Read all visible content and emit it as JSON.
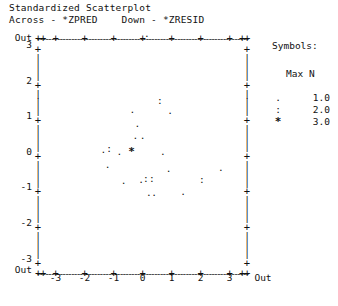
{
  "header": {
    "title": "Standardized Scatterplot",
    "axes_description": "Across - *ZPRED    Down - *ZRESID",
    "across_var": "*ZPRED",
    "down_var": "*ZRESID"
  },
  "legend": {
    "heading": "Symbols:",
    "column_header": "Max N",
    "entries": [
      {
        "symbol": ".",
        "value": "1.0"
      },
      {
        "symbol": ":",
        "value": "2.0"
      },
      {
        "symbol": "*",
        "value": "3.0"
      }
    ]
  },
  "axis": {
    "y_labels": [
      "Out",
      "3",
      "2",
      "1",
      "0",
      "-1",
      "-2",
      "-3",
      "Out"
    ],
    "x_labels": [
      "-3",
      "-2",
      "-1",
      "0",
      "1",
      "2",
      "3",
      "Out"
    ],
    "out_label": "Out",
    "tick_glyph": "+",
    "dash_glyph": "-",
    "bar_glyph": "|"
  },
  "chart_data": {
    "type": "scatter",
    "title": "Standardized Scatterplot",
    "xlabel": "*ZPRED",
    "ylabel": "*ZRESID",
    "xlim": [
      -3.5,
      3.5
    ],
    "ylim": [
      -3.5,
      3.5
    ],
    "grid": false,
    "legend_position": "right",
    "symbol_scale": [
      {
        "symbol": ".",
        "max_n": 1.0
      },
      {
        "symbol": ":",
        "max_n": 2.0
      },
      {
        "symbol": "*",
        "max_n": 3.0
      }
    ],
    "points": [
      {
        "x": 0.15,
        "y": 3.45,
        "symbol": "."
      },
      {
        "x": 0.6,
        "y": 1.55,
        "symbol": ":"
      },
      {
        "x": -0.35,
        "y": 1.3,
        "symbol": "."
      },
      {
        "x": 0.95,
        "y": 1.25,
        "symbol": "."
      },
      {
        "x": -0.18,
        "y": 0.9,
        "symbol": "."
      },
      {
        "x": -0.25,
        "y": 0.55,
        "symbol": "."
      },
      {
        "x": 0.0,
        "y": 0.55,
        "symbol": "."
      },
      {
        "x": -1.35,
        "y": 0.15,
        "symbol": "."
      },
      {
        "x": -1.15,
        "y": 0.18,
        "symbol": ":"
      },
      {
        "x": -0.8,
        "y": 0.12,
        "symbol": "."
      },
      {
        "x": -0.38,
        "y": 0.12,
        "symbol": "*"
      },
      {
        "x": 0.7,
        "y": 0.1,
        "symbol": "."
      },
      {
        "x": -1.2,
        "y": -0.25,
        "symbol": "."
      },
      {
        "x": 0.9,
        "y": -0.38,
        "symbol": "."
      },
      {
        "x": 2.7,
        "y": -0.35,
        "symbol": "."
      },
      {
        "x": -0.65,
        "y": -0.7,
        "symbol": "."
      },
      {
        "x": -0.05,
        "y": -0.68,
        "symbol": "."
      },
      {
        "x": 0.12,
        "y": -0.65,
        "symbol": ":"
      },
      {
        "x": 0.32,
        "y": -0.65,
        "symbol": ":"
      },
      {
        "x": 2.05,
        "y": -0.68,
        "symbol": ":"
      },
      {
        "x": 0.22,
        "y": -1.05,
        "symbol": "."
      },
      {
        "x": 0.4,
        "y": -1.05,
        "symbol": "."
      },
      {
        "x": 1.4,
        "y": -1.02,
        "symbol": "."
      }
    ]
  }
}
